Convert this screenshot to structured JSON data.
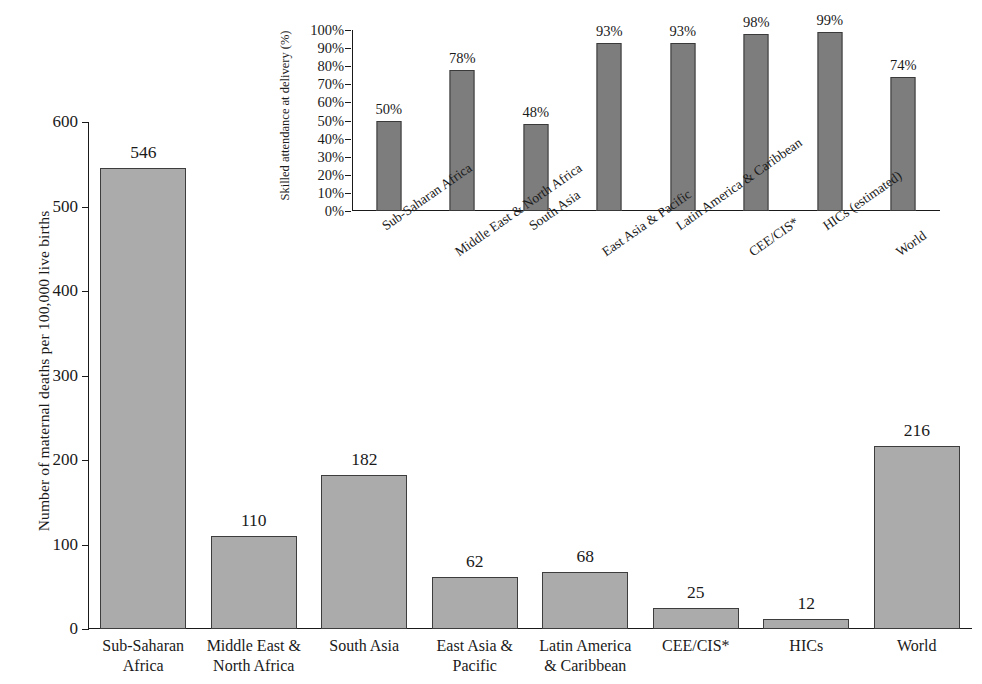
{
  "chart_data": [
    {
      "id": "main",
      "type": "bar",
      "title": "",
      "xlabel": "",
      "ylabel": "Number of maternal  deaths per 100,000 live births",
      "ylim": [
        0,
        600
      ],
      "yticks": [
        0,
        100,
        200,
        300,
        400,
        500,
        600
      ],
      "ytick_labels": [
        "0",
        "100",
        "200",
        "300",
        "400",
        "500",
        "600"
      ],
      "grid": false,
      "legend": "none",
      "bar_color": "#ababab",
      "bar_edge_color": "#3d3d3d",
      "categories": [
        "Sub-Saharan\nAfrica",
        "Middle East &\nNorth Africa",
        "South Asia",
        "East Asia &\nPacific",
        "Latin America\n& Caribbean",
        "CEE/CIS*",
        "HICs",
        "World"
      ],
      "category_lines": [
        [
          "Sub-Saharan",
          "Africa"
        ],
        [
          "Middle East &",
          "North Africa"
        ],
        [
          "South Asia",
          ""
        ],
        [
          "East Asia &",
          "Pacific"
        ],
        [
          "Latin America",
          "& Caribbean"
        ],
        [
          "CEE/CIS*",
          ""
        ],
        [
          "HICs",
          ""
        ],
        [
          "World",
          ""
        ]
      ],
      "values": [
        546,
        110,
        182,
        62,
        68,
        25,
        12,
        216
      ],
      "value_labels": [
        "546",
        "110",
        "182",
        "62",
        "68",
        "25",
        "12",
        "216"
      ]
    },
    {
      "id": "inset",
      "type": "bar",
      "title": "",
      "xlabel": "",
      "ylabel": "Skilled attendance at delivery (%)",
      "ylim": [
        0,
        100
      ],
      "yticks": [
        0,
        10,
        20,
        30,
        40,
        50,
        60,
        70,
        80,
        90,
        100
      ],
      "ytick_labels": [
        "0%",
        "10%",
        "20%",
        "30%",
        "40%",
        "50%",
        "60%",
        "70%",
        "80%",
        "90%",
        "100%"
      ],
      "grid": false,
      "legend": "none",
      "bar_color": "#7d7d7d",
      "bar_edge_color": "#3a3a3a",
      "categories": [
        "Sub-Saharan Africa",
        "Middle East & North Africa",
        "South Asia",
        "East Asia & Pacific",
        "Latin America & Caribbean",
        "CEE/CIS*",
        "HICs (estimated)",
        "World"
      ],
      "values": [
        50,
        78,
        48,
        93,
        93,
        98,
        99,
        74
      ],
      "value_labels": [
        "50%",
        "78%",
        "48%",
        "93%",
        "93%",
        "98%",
        "99%",
        "74%"
      ]
    }
  ]
}
